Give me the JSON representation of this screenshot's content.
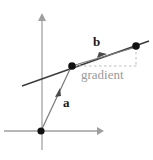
{
  "figure": {
    "background_color": "#ffffff",
    "axis_color": "#9e9e9e",
    "line_color": "#3a3a3a",
    "vector_color": "#6e6e6e",
    "dash_color": "#b9b9b9",
    "point_color": "#111111",
    "gradient_label_color": "#9a9a9a",
    "labels": {
      "vector_a": "a",
      "vector_b": "b",
      "gradient": "gradient"
    },
    "axes": {
      "origin": {
        "x": 41,
        "y": 131
      },
      "x_axis": {
        "x1": 4,
        "y1": 131,
        "x2": 103,
        "y2": 131,
        "arrow": "right"
      },
      "y_axis": {
        "x1": 42,
        "y1": 150,
        "x2": 42,
        "y2": 13,
        "arrow": "up"
      }
    },
    "points": [
      {
        "name": "origin-point",
        "x": 41,
        "y": 131
      },
      {
        "name": "point-a",
        "x": 72,
        "y": 66
      },
      {
        "name": "point-b",
        "x": 136,
        "y": 46
      }
    ],
    "line": {
      "x1": 22,
      "y1": 86,
      "x2": 148,
      "y2": 41
    },
    "vector_a": {
      "x1": 41,
      "y1": 131,
      "x2": 70,
      "y2": 68,
      "arrow_at": {
        "x": 58,
        "y": 92
      }
    },
    "vector_b": {
      "x1": 74,
      "y1": 65,
      "x2": 134,
      "y2": 47,
      "arrow_at": {
        "x": 104,
        "y": 56
      }
    },
    "dashed": {
      "horizontal": {
        "x1": 73,
        "y1": 66,
        "x2": 136,
        "y2": 66
      },
      "vertical": {
        "x1": 136,
        "y1": 47,
        "x2": 136,
        "y2": 66
      }
    },
    "label_positions": {
      "vector_a": {
        "x": 63,
        "y": 96
      },
      "vector_b": {
        "x": 93,
        "y": 35
      },
      "gradient": {
        "x": 81,
        "y": 68
      }
    }
  }
}
